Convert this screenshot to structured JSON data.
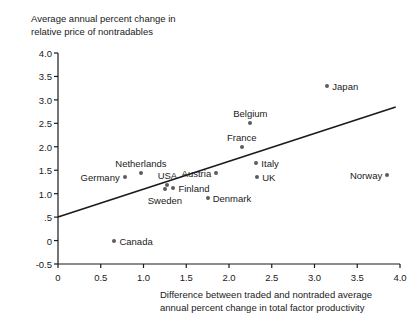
{
  "chart_data": {
    "type": "scatter",
    "title": "",
    "ylabel": "Average annual percent change in\nrelative price of nontradables",
    "xlabel": "Difference between traded and nontraded average\nannual percent change in total factor productivity",
    "xlim": [
      0,
      4.0
    ],
    "ylim": [
      -0.5,
      4.0
    ],
    "grid": false,
    "legend": "none",
    "xticks": [
      "0",
      "0.5",
      "1.0",
      "1.5",
      "2.0",
      "2.5",
      "3.0",
      "3.5",
      "4.0"
    ],
    "xtick_values": [
      0,
      0.5,
      1.0,
      1.5,
      2.0,
      2.5,
      3.0,
      3.5,
      4.0
    ],
    "yticks": [
      "4.0",
      "3.5",
      "3.0",
      "2.5",
      "2.0",
      "1.5",
      "1.0",
      ".5",
      "0",
      "-0.5"
    ],
    "ytick_values": [
      4.0,
      3.5,
      3.0,
      2.5,
      2.0,
      1.5,
      1.0,
      0.5,
      0.0,
      -0.5
    ],
    "points": [
      {
        "name": "Japan",
        "x": 3.15,
        "y": 3.3,
        "label_pos": "right"
      },
      {
        "name": "Belgium",
        "x": 2.25,
        "y": 2.5,
        "label_pos": "above"
      },
      {
        "name": "France",
        "x": 2.15,
        "y": 2.0,
        "label_pos": "above"
      },
      {
        "name": "Italy",
        "x": 2.32,
        "y": 1.65,
        "label_pos": "right"
      },
      {
        "name": "Austria",
        "x": 1.85,
        "y": 1.45,
        "label_pos": "left"
      },
      {
        "name": "UK",
        "x": 2.33,
        "y": 1.35,
        "label_pos": "right"
      },
      {
        "name": "Norway",
        "x": 3.85,
        "y": 1.4,
        "label_pos": "left"
      },
      {
        "name": "Netherlands",
        "x": 0.97,
        "y": 1.45,
        "label_pos": "above"
      },
      {
        "name": "Germany",
        "x": 0.78,
        "y": 1.35,
        "label_pos": "left"
      },
      {
        "name": "USA",
        "x": 1.28,
        "y": 1.18,
        "label_pos": "above"
      },
      {
        "name": "Finland",
        "x": 1.35,
        "y": 1.12,
        "label_pos": "right"
      },
      {
        "name": "Sweden",
        "x": 1.25,
        "y": 1.1,
        "label_pos": "below"
      },
      {
        "name": "Denmark",
        "x": 1.75,
        "y": 0.9,
        "label_pos": "right"
      },
      {
        "name": "Canada",
        "x": 0.66,
        "y": 0.0,
        "label_pos": "right"
      }
    ],
    "trendline": {
      "x0": 0.0,
      "y0": 0.5,
      "x1": 3.95,
      "y1": 2.85
    },
    "colors": {
      "dot": "#5c5c5c",
      "line": "#1a1a1a",
      "axis": "#1a1a1a",
      "text": "#1a1a1a",
      "background": "#ffffff"
    }
  }
}
